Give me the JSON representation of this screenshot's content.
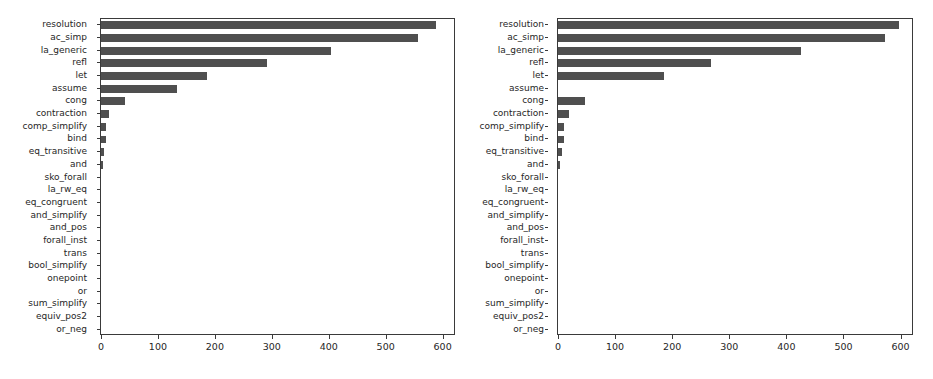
{
  "chart_data": [
    {
      "type": "bar",
      "orientation": "horizontal",
      "panel": "left",
      "title": "",
      "xlabel": "",
      "ylabel": "",
      "xlim": [
        0,
        620
      ],
      "xticks": [
        0,
        100,
        200,
        300,
        400,
        500,
        600
      ],
      "xticklabels": [
        "0",
        "100",
        "200",
        "300",
        "400",
        "500",
        "600"
      ],
      "grid": false,
      "legend": null,
      "bar_color": "#4f4f4f",
      "categories": [
        "resolution",
        "ac_simp",
        "la_generic",
        "refl",
        "let",
        "assume",
        "cong",
        "contraction",
        "comp_simplify",
        "bind",
        "eq_transitive",
        "and",
        "sko_forall",
        "la_rw_eq",
        "eq_congruent",
        "and_simplify",
        "and_pos",
        "forall_inst",
        "trans",
        "bool_simplify",
        "onepoint",
        "or",
        "sum_simplify",
        "equiv_pos2",
        "or_neg"
      ],
      "values": [
        588,
        557,
        404,
        292,
        186,
        133,
        43,
        14,
        8,
        8,
        6,
        1,
        0,
        0,
        0,
        0,
        0,
        0,
        0,
        0,
        0,
        0,
        0,
        0,
        0
      ]
    },
    {
      "type": "bar",
      "orientation": "horizontal",
      "panel": "right",
      "title": "",
      "xlabel": "",
      "ylabel": "",
      "xlim": [
        0,
        620
      ],
      "xticks": [
        0,
        100,
        200,
        300,
        400,
        500,
        600
      ],
      "xticklabels": [
        "0",
        "100",
        "200",
        "300",
        "400",
        "500",
        "600"
      ],
      "grid": false,
      "legend": null,
      "bar_color": "#4f4f4f",
      "categories": [
        "resolution",
        "ac_simp",
        "la_generic",
        "refl",
        "let",
        "assume",
        "cong",
        "contraction",
        "comp_simplify",
        "bind",
        "eq_transitive",
        "and",
        "sko_forall",
        "la_rw_eq",
        "eq_congruent",
        "and_simplify",
        "and_pos",
        "forall_inst",
        "trans",
        "bool_simplify",
        "onepoint",
        "or",
        "sum_simplify",
        "equiv_pos2",
        "or_neg"
      ],
      "values": [
        598,
        572,
        426,
        268,
        186,
        0,
        48,
        19,
        10,
        11,
        7,
        1,
        0,
        0,
        0,
        0,
        0,
        0,
        0,
        0,
        0,
        0,
        0,
        0,
        0
      ]
    }
  ]
}
